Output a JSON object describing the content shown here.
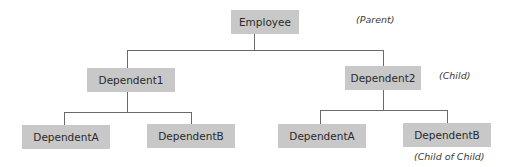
{
  "diagram": {
    "type": "tree",
    "nodes": {
      "root": {
        "label": "Employee"
      },
      "child1": {
        "label": "Dependent1"
      },
      "child2": {
        "label": "Dependent2"
      },
      "child1_a": {
        "label": "DependentA"
      },
      "child1_b": {
        "label": "DependentB"
      },
      "child2_a": {
        "label": "DependentA"
      },
      "child2_b": {
        "label": "DependentB"
      }
    },
    "annotations": {
      "parent": "(Parent)",
      "child": "(Child)",
      "child_of_child": "(Child of Child)"
    },
    "edges": [
      [
        "Employee",
        "Dependent1"
      ],
      [
        "Employee",
        "Dependent2"
      ],
      [
        "Dependent1",
        "DependentA"
      ],
      [
        "Dependent1",
        "DependentB"
      ],
      [
        "Dependent2",
        "DependentA"
      ],
      [
        "Dependent2",
        "DependentB"
      ]
    ],
    "colors": {
      "box_fill": "#c8c8c8",
      "connector": "#6a6a6a",
      "text": "#2a2a2a"
    }
  }
}
